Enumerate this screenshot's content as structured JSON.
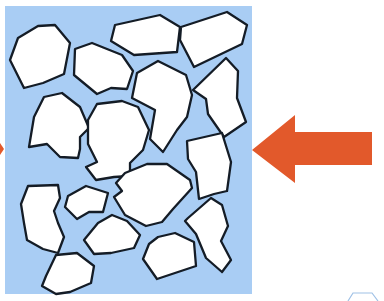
{
  "diagram": {
    "title": "",
    "background": "#ffffff",
    "panel": {
      "x": 5,
      "y": 6,
      "width": 247,
      "height": 288,
      "fill": "#a9cdf4"
    },
    "shape_style": {
      "fill": "#ffffff",
      "stroke": "#141c26",
      "stroke_width": 2.3
    },
    "shapes": [
      {
        "name": "fragment-1",
        "points": "38,26 55,25 70,43 64,74 43,83 24,88 10,60 18,38"
      },
      {
        "name": "fragment-2",
        "points": "115,25 160,15 180,27 177,52 134,55 111,41"
      },
      {
        "name": "fragment-3",
        "points": "181,27 227,12 247,25 242,44 194,67 180,40"
      },
      {
        "name": "fragment-4",
        "points": "75,49 92,43 122,55 133,71 127,89 111,88 97,94 74,75"
      },
      {
        "name": "fragment-5",
        "points": "137,73 158,61 186,75 192,95 187,117 177,130 163,152 150,139 155,110 132,98"
      },
      {
        "name": "fragment-6",
        "points": "193,90 226,58 238,71 237,98 246,122 224,137 208,114 206,99"
      },
      {
        "name": "fragment-7",
        "points": "44,97 62,93 80,107 89,128 80,137 80,149 78,158 60,157 47,144 29,147 34,117"
      },
      {
        "name": "fragment-8",
        "points": "97,104 122,101 138,107 149,130 143,150 130,163 130,176 114,177 96,180 86,167 97,162 88,144 88,120"
      },
      {
        "name": "fragment-9",
        "points": "187,141 222,133 231,162 227,191 214,194 199,199 196,172 188,159"
      },
      {
        "name": "fragment-10",
        "points": "125,173 147,164 167,164 190,180 192,188 173,209 162,222 146,226 125,215 114,197 122,191 116,183"
      },
      {
        "name": "fragment-11",
        "points": "28,186 58,185 60,198 54,211 58,223 64,237 58,253 43,249 27,240 24,223 21,204"
      },
      {
        "name": "fragment-12",
        "points": "68,196 86,186 108,193 103,212 89,212 77,219 65,207"
      },
      {
        "name": "fragment-13",
        "points": "188,218 211,198 222,205 228,226 221,241 231,260 222,272 206,258 196,234 185,221"
      },
      {
        "name": "fragment-14",
        "points": "98,223 112,215 127,221 140,235 134,248 111,253 94,254 84,240"
      },
      {
        "name": "fragment-15",
        "points": "158,237 175,233 194,242 196,266 178,272 157,279 143,259 149,244"
      },
      {
        "name": "fragment-16",
        "points": "56,255 77,253 94,266 91,283 70,292 56,294 42,286 46,276"
      }
    ],
    "arrow": {
      "name": "incoming-arrow",
      "direction": "left",
      "color": "#e2592b",
      "points": "252,150 295,115 295,132 372,132 372,165 295,165 295,183"
    },
    "edge_marks": [
      {
        "name": "left-edge-arrow-tip",
        "color": "#e2592b",
        "points": "0,143 4,149 0,155"
      },
      {
        "name": "partial-hexagon-outline",
        "stroke": "#9fc1e6",
        "points": "348,301 353,293 372,293 378,301"
      }
    ]
  }
}
